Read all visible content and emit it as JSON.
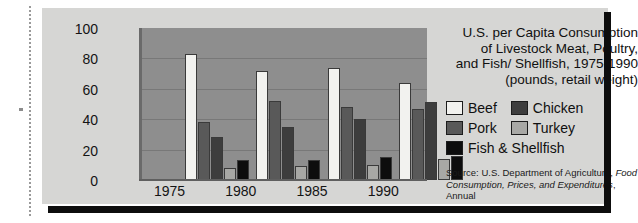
{
  "chart_data": {
    "type": "bar",
    "title": [
      "U.S. per Capita Consumption",
      "of Livestock Meat, Poultry,",
      "and Fish/ Shellfish, 1975-1990",
      "(pounds, retail weight)"
    ],
    "title_text": "U.S. per Capita Consumption of Livestock Meat, Poultry, and Fish/ Shellfish, 1975-1990 (pounds, retail weight)",
    "xlabel": "",
    "ylabel": "",
    "ylim": [
      0,
      100
    ],
    "yticks": [
      100,
      80,
      60,
      40,
      20,
      0
    ],
    "grid": true,
    "legend_position": "right",
    "categories": [
      "1975",
      "1980",
      "1985",
      "1990"
    ],
    "series": [
      {
        "name": "Beef",
        "color": "#f2f2ef",
        "values": [
          83,
          72,
          74,
          64
        ]
      },
      {
        "name": "Pork",
        "color": "#595959",
        "values": [
          38,
          52,
          48,
          47
        ]
      },
      {
        "name": "Chicken",
        "color": "#3d3d3d",
        "values": [
          28,
          35,
          40,
          51
        ]
      },
      {
        "name": "Turkey",
        "color": "#a8a8a5",
        "values": [
          8,
          9,
          10,
          14
        ]
      },
      {
        "name": "Fish & Shellfish",
        "color": "#0d0d0d",
        "values": [
          13,
          13,
          15,
          16
        ]
      }
    ],
    "source": {
      "prefix": "Source: U.S. Department of Agriculture,",
      "italic": "Food Consumption, Prices, and Expenditures",
      "suffix": ", Annual"
    },
    "colors": {
      "plot_background": "#8e8e8e",
      "card_background": "#d6d6d4",
      "gridline": "#787878",
      "rule": "#0d0d0d"
    }
  }
}
